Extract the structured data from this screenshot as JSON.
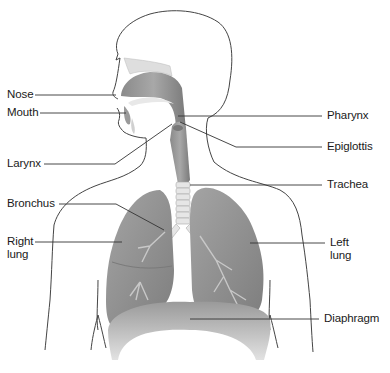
{
  "diagram": {
    "colors": {
      "outline": "#444444",
      "organ_fill": "#8d8d8d",
      "organ_light": "#b8b8b8",
      "leader_line": "#333333",
      "label_text": "#1a1a1a",
      "background": "#ffffff"
    },
    "labels": {
      "nose": "Nose",
      "mouth": "Mouth",
      "larynx": "Larynx",
      "bronchus": "Bronchus",
      "right_lung_1": "Right",
      "right_lung_2": "lung",
      "pharynx": "Pharynx",
      "epiglottis": "Epiglottis",
      "trachea": "Trachea",
      "left_lung_1": "Left",
      "left_lung_2": "lung",
      "diaphragm": "Diaphragm"
    }
  }
}
